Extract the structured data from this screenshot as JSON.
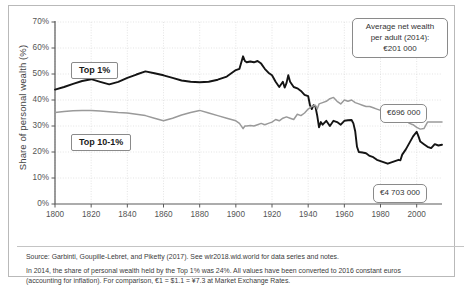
{
  "chart_data": {
    "type": "line",
    "title": "",
    "xlabel": "",
    "ylabel": "Share of personal wealth (%)",
    "xlim": [
      1800,
      2014
    ],
    "ylim": [
      0,
      70
    ],
    "grid": true,
    "legend_position": "inline-labels",
    "x_ticks": [
      "1800",
      "1820",
      "1840",
      "1860",
      "1880",
      "1900",
      "1920",
      "1940",
      "1960",
      "1980",
      "2000"
    ],
    "y_ticks": [
      "0%",
      "10%",
      "20%",
      "30%",
      "40%",
      "50%",
      "60%",
      "70%"
    ],
    "series": [
      {
        "name": "Top 1%",
        "color": "#141414",
        "x": [
          1800,
          1805,
          1810,
          1815,
          1820,
          1825,
          1830,
          1835,
          1840,
          1845,
          1850,
          1855,
          1860,
          1865,
          1870,
          1875,
          1880,
          1885,
          1890,
          1895,
          1900,
          1902,
          1904,
          1905,
          1906,
          1908,
          1910,
          1912,
          1914,
          1916,
          1918,
          1920,
          1922,
          1924,
          1926,
          1927,
          1928,
          1929,
          1930,
          1932,
          1934,
          1936,
          1938,
          1940,
          1941,
          1942,
          1943,
          1944,
          1945,
          1946,
          1947,
          1948,
          1950,
          1952,
          1954,
          1956,
          1958,
          1960,
          1962,
          1964,
          1965,
          1966,
          1967,
          1968,
          1970,
          1972,
          1974,
          1976,
          1978,
          1980,
          1982,
          1984,
          1986,
          1988,
          1990,
          1991,
          1992,
          1994,
          1996,
          1998,
          2000,
          2001,
          2002,
          2004,
          2006,
          2008,
          2010,
          2012,
          2014
        ],
        "values": [
          44.0,
          45.0,
          46.2,
          47.3,
          48.0,
          47.0,
          46.0,
          47.0,
          48.5,
          49.8,
          51.0,
          50.3,
          49.5,
          48.5,
          47.5,
          47.0,
          46.8,
          47.0,
          47.8,
          49.0,
          51.5,
          52.0,
          56.8,
          55.0,
          54.5,
          54.8,
          54.5,
          55.0,
          54.0,
          52.0,
          50.5,
          49.5,
          47.0,
          45.0,
          47.0,
          44.8,
          46.5,
          49.5,
          47.0,
          45.0,
          44.5,
          43.5,
          42.0,
          41.5,
          38.0,
          36.5,
          38.0,
          37.5,
          34.0,
          29.5,
          31.5,
          30.5,
          32.0,
          30.0,
          32.0,
          31.5,
          30.5,
          32.0,
          32.2,
          32.3,
          31.0,
          28.0,
          22.0,
          20.0,
          19.8,
          19.5,
          18.5,
          18.0,
          17.0,
          16.5,
          16.0,
          15.5,
          16.0,
          16.5,
          17.0,
          16.8,
          19.0,
          21.0,
          23.5,
          26.0,
          27.8,
          26.0,
          24.0,
          23.0,
          22.0,
          21.5,
          23.0,
          22.5,
          22.8
        ],
        "end_callout": "€4 703 000"
      },
      {
        "name": "Top 10-1%",
        "color": "#9a9a9a",
        "x": [
          1800,
          1805,
          1810,
          1815,
          1820,
          1825,
          1830,
          1835,
          1840,
          1845,
          1850,
          1855,
          1860,
          1865,
          1870,
          1875,
          1880,
          1885,
          1890,
          1895,
          1900,
          1902,
          1904,
          1905,
          1906,
          1908,
          1910,
          1912,
          1914,
          1916,
          1918,
          1920,
          1922,
          1924,
          1926,
          1928,
          1930,
          1932,
          1934,
          1936,
          1938,
          1940,
          1942,
          1944,
          1945,
          1946,
          1948,
          1950,
          1952,
          1954,
          1956,
          1958,
          1960,
          1962,
          1964,
          1966,
          1968,
          1970,
          1972,
          1974,
          1976,
          1978,
          1980,
          1982,
          1984,
          1986,
          1988,
          1990,
          1992,
          1994,
          1996,
          1998,
          2000,
          2002,
          2004,
          2006,
          2008,
          2010,
          2012,
          2014
        ],
        "values": [
          35.2,
          35.6,
          35.9,
          36.0,
          36.0,
          35.8,
          35.5,
          35.2,
          35.0,
          34.5,
          34.0,
          33.0,
          32.0,
          33.0,
          34.2,
          35.2,
          36.0,
          35.0,
          34.0,
          33.0,
          32.0,
          31.0,
          29.0,
          30.0,
          30.0,
          30.2,
          30.0,
          30.5,
          31.0,
          30.5,
          31.0,
          31.5,
          32.5,
          32.0,
          33.0,
          33.5,
          33.0,
          32.5,
          34.5,
          34.0,
          35.0,
          36.5,
          37.5,
          38.0,
          36.5,
          38.5,
          39.0,
          39.5,
          40.5,
          41.0,
          39.5,
          38.5,
          40.0,
          39.5,
          40.0,
          39.0,
          38.5,
          38.0,
          37.5,
          37.5,
          37.0,
          36.5,
          36.0,
          35.5,
          35.0,
          34.5,
          34.0,
          33.5,
          33.0,
          32.5,
          31.0,
          30.5,
          29.5,
          28.8,
          29.0,
          31.5,
          31.5,
          31.5,
          31.5,
          31.5
        ],
        "end_callout": "€696 000"
      }
    ],
    "annotations": [
      {
        "name": "average-net-wealth",
        "lines": [
          "Average net wealth",
          "per adult (2014):",
          "€201 000"
        ]
      },
      {
        "name": "top10-callout",
        "text": "€696 000"
      },
      {
        "name": "top1-callout",
        "text": "€4 703 000"
      }
    ]
  },
  "labels": {
    "top1": "Top 1%",
    "top10_1": "Top 10-1%"
  },
  "callouts": {
    "average_line1": "Average net wealth",
    "average_line2": "per adult (2014):",
    "average_line3": "€201 000",
    "top10_value": "€696 000",
    "top1_value": "€4 703 000"
  },
  "footnotes": {
    "source": "Source: Garbinti, Goupille-Lebret, and Piketty (2017). See wir2018.wid.world for data series and notes.",
    "note_line1": "In 2014, the share of personal wealth held by the Top 1% was 24%. All values have been converted to 2016 constant euros",
    "note_line2": "(accounting for inflation). For comparison, €1 = $1.1 = ¥7.3 at Market Exchange Rates."
  }
}
